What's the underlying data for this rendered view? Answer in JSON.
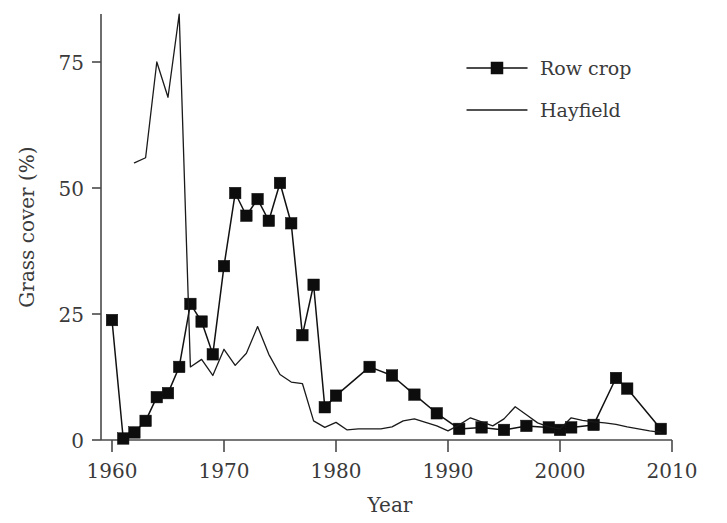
{
  "chart_data": {
    "type": "line",
    "title": "",
    "xlabel": "Year",
    "ylabel": "Grass cover (%)",
    "xlim": [
      1960,
      2010
    ],
    "ylim": [
      0,
      87
    ],
    "grid": false,
    "legend_position": "top-right",
    "xticks": [
      1960,
      1970,
      1980,
      1990,
      2000,
      2010
    ],
    "xtick_labels": [
      "1960",
      "1970",
      "1980",
      "1990",
      "2000",
      "2010"
    ],
    "yticks": [
      0,
      25,
      50,
      75
    ],
    "ytick_labels": [
      "0",
      "25",
      "50",
      "75"
    ],
    "series": [
      {
        "name": "Row crop",
        "marker": "square",
        "color": "#0d0d0d",
        "x": [
          1960,
          1961,
          1962,
          1963,
          1964,
          1965,
          1966,
          1967,
          1968,
          1969,
          1970,
          1971,
          1972,
          1973,
          1974,
          1975,
          1976,
          1977,
          1978,
          1979,
          1980,
          1983,
          1985,
          1987,
          1989,
          1991,
          1993,
          1995,
          1997,
          1999,
          2000,
          2001,
          2003,
          2005,
          2006,
          2009
        ],
        "values": [
          23.8,
          0.3,
          1.5,
          3.8,
          8.5,
          9.3,
          14.5,
          27.0,
          23.5,
          17.0,
          34.5,
          49.0,
          44.5,
          47.8,
          43.5,
          51.0,
          43.0,
          20.8,
          30.8,
          6.5,
          8.8,
          14.5,
          12.8,
          9.0,
          5.3,
          2.2,
          2.5,
          2.0,
          2.8,
          2.5,
          2.0,
          2.5,
          3.0,
          12.3,
          10.2,
          2.2
        ]
      },
      {
        "name": "Hayfield",
        "marker": "none",
        "color": "#1a1a1a",
        "x": [
          1962,
          1963,
          1964,
          1965,
          1966,
          1967,
          1968,
          1969,
          1970,
          1971,
          1972,
          1973,
          1974,
          1975,
          1976,
          1977,
          1978,
          1979,
          1980,
          1981,
          1982,
          1983,
          1984,
          1985,
          1986,
          1987,
          1988,
          1989,
          1990,
          1991,
          1992,
          1993,
          1994,
          1995,
          1996,
          1997,
          1998,
          1999,
          2000,
          2001,
          2002,
          2003,
          2004,
          2005,
          2006,
          2007,
          2008,
          2009
        ],
        "values": [
          55.0,
          56.0,
          75.0,
          68.0,
          84.5,
          14.5,
          16.0,
          12.8,
          18.0,
          14.8,
          17.2,
          22.5,
          17.0,
          13.0,
          11.5,
          11.2,
          3.8,
          2.5,
          3.5,
          2.0,
          2.2,
          2.2,
          2.2,
          2.6,
          3.8,
          4.2,
          3.5,
          2.8,
          1.8,
          3.0,
          4.4,
          3.6,
          2.8,
          4.2,
          6.6,
          5.0,
          3.4,
          2.6,
          2.2,
          4.4,
          3.9,
          3.6,
          3.4,
          3.1,
          2.6,
          2.2,
          1.8,
          1.5
        ]
      }
    ],
    "legend": [
      {
        "label": "Row crop",
        "marker": "square"
      },
      {
        "label": "Hayfield",
        "marker": "none"
      }
    ]
  }
}
